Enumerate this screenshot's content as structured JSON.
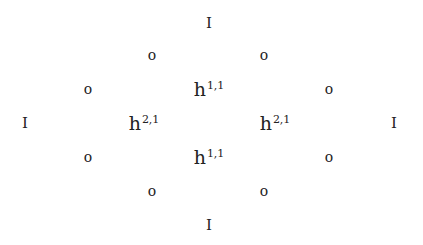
{
  "diagram": {
    "type": "hodge-diamond",
    "text_color": "#222222",
    "background": "#ffffff",
    "rows": [
      {
        "cells": [
          {
            "label": "I",
            "kind": "one",
            "x": 209,
            "y": 23
          }
        ]
      },
      {
        "cells": [
          {
            "label": "o",
            "kind": "zero",
            "x": 152,
            "y": 55
          },
          {
            "label": "o",
            "kind": "zero",
            "x": 264,
            "y": 55
          }
        ]
      },
      {
        "cells": [
          {
            "label": "o",
            "kind": "zero",
            "x": 88,
            "y": 89
          },
          {
            "base": "h",
            "sup": "1,1",
            "kind": "hodge",
            "x": 209,
            "y": 89
          },
          {
            "label": "o",
            "kind": "zero",
            "x": 329,
            "y": 89
          }
        ]
      },
      {
        "cells": [
          {
            "label": "I",
            "kind": "one",
            "x": 25,
            "y": 123
          },
          {
            "base": "h",
            "sup": "2,1",
            "kind": "hodge",
            "x": 144,
            "y": 123
          },
          {
            "base": "h",
            "sup": "2,1",
            "kind": "hodge",
            "x": 275,
            "y": 123
          },
          {
            "label": "I",
            "kind": "one",
            "x": 394,
            "y": 123
          }
        ]
      },
      {
        "cells": [
          {
            "label": "o",
            "kind": "zero",
            "x": 88,
            "y": 157
          },
          {
            "base": "h",
            "sup": "1,1",
            "kind": "hodge",
            "x": 209,
            "y": 157
          },
          {
            "label": "o",
            "kind": "zero",
            "x": 329,
            "y": 157
          }
        ]
      },
      {
        "cells": [
          {
            "label": "o",
            "kind": "zero",
            "x": 152,
            "y": 191
          },
          {
            "label": "o",
            "kind": "zero",
            "x": 264,
            "y": 191
          }
        ]
      },
      {
        "cells": [
          {
            "label": "I",
            "kind": "one",
            "x": 209,
            "y": 225
          }
        ]
      }
    ]
  }
}
